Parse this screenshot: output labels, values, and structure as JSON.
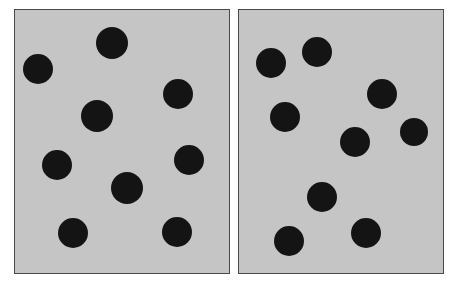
{
  "figure": {
    "kind": "numerosity-comparison-stimulus",
    "background_color": "#ffffff",
    "panel_fill_color": "#c5c5c5",
    "panel_border_color": "#4a4a4a",
    "dot_color": "#141414",
    "panel_count": 2,
    "total_dots": 18
  },
  "chart_data": {
    "type": "scatter",
    "title": "",
    "subtitle": "",
    "xlabel": "",
    "ylabel": "",
    "grid": false,
    "legend": null,
    "units": "pixels",
    "canvas": {
      "width": 457,
      "height": 284
    },
    "panels": [
      {
        "id": "left-panel",
        "label": "Left array",
        "dot_count": 9,
        "rect": {
          "x": 14,
          "y": 9,
          "width": 216,
          "height": 265
        },
        "fill": "#c5c5c5",
        "border": "#4a4a4a",
        "dots": [
          {
            "id": "L1",
            "cx": 38,
            "cy": 69,
            "r": 15
          },
          {
            "id": "L2",
            "cx": 112,
            "cy": 43,
            "r": 16
          },
          {
            "id": "L3",
            "cx": 178,
            "cy": 94,
            "r": 15
          },
          {
            "id": "L4",
            "cx": 97,
            "cy": 116,
            "r": 16
          },
          {
            "id": "L5",
            "cx": 189,
            "cy": 160,
            "r": 15
          },
          {
            "id": "L6",
            "cx": 57,
            "cy": 165,
            "r": 15
          },
          {
            "id": "L7",
            "cx": 127,
            "cy": 188,
            "r": 16
          },
          {
            "id": "L8",
            "cx": 73,
            "cy": 233,
            "r": 15
          },
          {
            "id": "L9",
            "cx": 177,
            "cy": 232,
            "r": 15
          }
        ]
      },
      {
        "id": "right-panel",
        "label": "Right array",
        "dot_count": 9,
        "rect": {
          "x": 238,
          "y": 9,
          "width": 206,
          "height": 265
        },
        "fill": "#c5c5c5",
        "border": "#4a4a4a",
        "dots": [
          {
            "id": "R1",
            "cx": 271,
            "cy": 63,
            "r": 15
          },
          {
            "id": "R2",
            "cx": 317,
            "cy": 52,
            "r": 15
          },
          {
            "id": "R3",
            "cx": 285,
            "cy": 117,
            "r": 15
          },
          {
            "id": "R4",
            "cx": 382,
            "cy": 94,
            "r": 15
          },
          {
            "id": "R5",
            "cx": 414,
            "cy": 132,
            "r": 14
          },
          {
            "id": "R6",
            "cx": 355,
            "cy": 142,
            "r": 15
          },
          {
            "id": "R7",
            "cx": 322,
            "cy": 197,
            "r": 15
          },
          {
            "id": "R8",
            "cx": 366,
            "cy": 233,
            "r": 15
          },
          {
            "id": "R9",
            "cx": 289,
            "cy": 241,
            "r": 15
          }
        ]
      }
    ]
  }
}
